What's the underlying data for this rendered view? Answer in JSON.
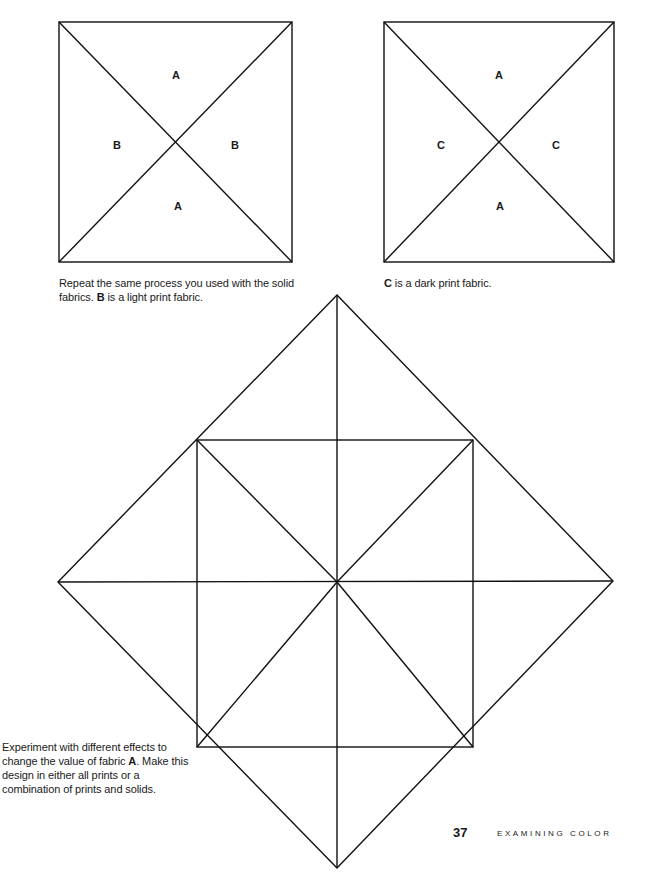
{
  "page": {
    "number": "37",
    "running_head": "EXAMINING COLOR"
  },
  "figures": [
    {
      "id": "block-ab",
      "labels": {
        "top": "A",
        "left": "B",
        "right": "B",
        "bottom": "A"
      },
      "caption_pre": "Repeat the same process you used with the solid fabrics. ",
      "caption_bold": "B",
      "caption_post": " is a light print fabric."
    },
    {
      "id": "block-ac",
      "labels": {
        "top": "A",
        "left": "C",
        "right": "C",
        "bottom": "A"
      },
      "caption_bold": "C",
      "caption_post": " is a dark print fabric."
    },
    {
      "id": "diamond-block",
      "caption_pre": "Experiment with different effects to change the value of fabric ",
      "caption_bold": "A",
      "caption_post": ". Make this design in either all prints or a combination of prints and solids."
    }
  ],
  "colors": {
    "line": "#111111",
    "text": "#1a1a1a",
    "background": "#ffffff"
  }
}
